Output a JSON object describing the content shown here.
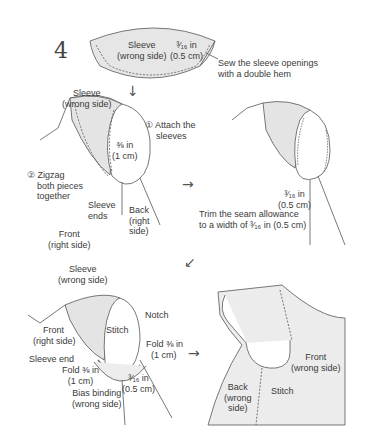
{
  "step_number": "4",
  "panel_1": {
    "sleeve_label_line1": "Sleeve",
    "sleeve_label_line2": "(wrong side)",
    "hem_width_line1": "³⁄₁₆ in",
    "hem_width_line2": "(0.5 cm)",
    "instruction_line1": "Sew the sleeve openings",
    "instruction_line2": "with a double hem"
  },
  "panel_2": {
    "sleeve_label_line1": "Sleeve",
    "sleeve_label_line2": "(wrong side)",
    "attach_line1": "① Attach the",
    "attach_line2": "sleeves",
    "seam_line1": "⅜ in",
    "seam_line2": "(1 cm)",
    "zigzag_line1": "② Zigzag",
    "zigzag_line2": "both pieces",
    "zigzag_line3": "together",
    "sleeve_ends_line1": "Sleeve",
    "sleeve_ends_line2": "ends",
    "back_line1": "Back",
    "back_line2": "(right",
    "back_line3": "side)",
    "front_line1": "Front",
    "front_line2": "(right side)"
  },
  "panel_3": {
    "trim_width_line1": "³⁄₁₆ in",
    "trim_width_line2": "(0.5 cm)",
    "instruction_line1": "Trim the seam allowance",
    "instruction_line2": "to a width of ³⁄₁₆ in (0.5 cm)"
  },
  "panel_4": {
    "sleeve_label_line1": "Sleeve",
    "sleeve_label_line2": "(wrong side)",
    "notch": "Notch",
    "stitch": "Stitch",
    "front_line1": "Front",
    "front_line2": "(right side)",
    "fold_right_line1": "Fold ⅜ in",
    "fold_right_line2": "(1 cm)",
    "sleeve_end": "Sleeve end",
    "fold_left_line1": "Fold ⅜ in",
    "fold_left_line2": "(1 cm)",
    "width_line1": "³⁄₁₆ in",
    "width_line2": "(0.5 cm)",
    "binding_line1": "Bias binding",
    "binding_line2": "(wrong side)"
  },
  "panel_5": {
    "front_line1": "Front",
    "front_line2": "(wrong side)",
    "back_line1": "Back",
    "back_line2": "(wrong",
    "back_line3": "side)",
    "stitch": "Stitch"
  },
  "arrows": {
    "down": "↓",
    "right_1": "→",
    "down_left": "↙",
    "right_2": "→"
  },
  "colors": {
    "line": "#555555",
    "fill_shade": "#e4e4e4",
    "fill_light": "#ededed",
    "text": "#3a3a3a"
  }
}
